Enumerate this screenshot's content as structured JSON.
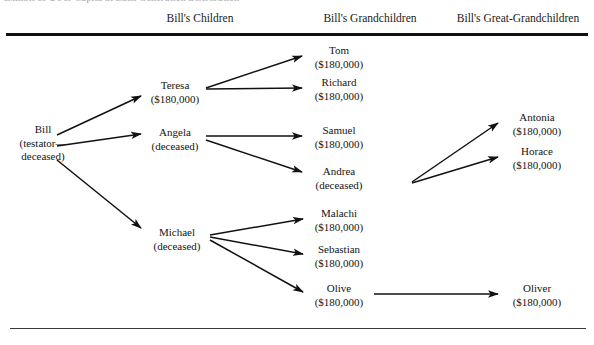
{
  "figure": {
    "clipped_caption": "Exhibit  19-2  Per Capita at Each Generation Distribution",
    "columns": [
      {
        "id": "children",
        "label": "Bill's Children"
      },
      {
        "id": "grandchildren",
        "label": "Bill's Grandchildren"
      },
      {
        "id": "great_grandchildren",
        "label": "Bill's Great-Grandchildren"
      }
    ],
    "nodes": [
      {
        "id": "bill",
        "name": "Bill",
        "sub1": "(testator—",
        "sub2": "deceased)",
        "generation": "testator",
        "amount": null
      },
      {
        "id": "teresa",
        "name": "Teresa",
        "sub1": "($180,000)",
        "sub2": "",
        "generation": "children",
        "amount": "$180,000"
      },
      {
        "id": "angela",
        "name": "Angela",
        "sub1": "(deceased)",
        "sub2": "",
        "generation": "children",
        "amount": null
      },
      {
        "id": "michael",
        "name": "Michael",
        "sub1": "(deceased)",
        "sub2": "",
        "generation": "children",
        "amount": null
      },
      {
        "id": "tom",
        "name": "Tom",
        "sub1": "($180,000)",
        "sub2": "",
        "generation": "grandchildren",
        "amount": "$180,000"
      },
      {
        "id": "richard",
        "name": "Richard",
        "sub1": "($180,000)",
        "sub2": "",
        "generation": "grandchildren",
        "amount": "$180,000"
      },
      {
        "id": "samuel",
        "name": "Samuel",
        "sub1": "($180,000)",
        "sub2": "",
        "generation": "grandchildren",
        "amount": "$180,000"
      },
      {
        "id": "andrea",
        "name": "Andrea",
        "sub1": "(deceased)",
        "sub2": "",
        "generation": "grandchildren",
        "amount": null
      },
      {
        "id": "malachi",
        "name": "Malachi",
        "sub1": "($180,000)",
        "sub2": "",
        "generation": "grandchildren",
        "amount": "$180,000"
      },
      {
        "id": "sebastian",
        "name": "Sebastian",
        "sub1": "($180,000)",
        "sub2": "",
        "generation": "grandchildren",
        "amount": "$180,000"
      },
      {
        "id": "olive",
        "name": "Olive",
        "sub1": "($180,000)",
        "sub2": "",
        "generation": "grandchildren",
        "amount": "$180,000"
      },
      {
        "id": "antonia",
        "name": "Antonia",
        "sub1": "($180,000)",
        "sub2": "",
        "generation": "great_grandchildren",
        "amount": "$180,000"
      },
      {
        "id": "horace",
        "name": "Horace",
        "sub1": "($180,000)",
        "sub2": "",
        "generation": "great_grandchildren",
        "amount": "$180,000"
      },
      {
        "id": "oliver",
        "name": "Oliver",
        "sub1": "($180,000)",
        "sub2": "",
        "generation": "great_grandchildren",
        "amount": "$180,000"
      }
    ],
    "edges": [
      {
        "from": "bill",
        "to": "teresa"
      },
      {
        "from": "bill",
        "to": "angela"
      },
      {
        "from": "bill",
        "to": "michael"
      },
      {
        "from": "teresa",
        "to": "tom"
      },
      {
        "from": "teresa",
        "to": "richard"
      },
      {
        "from": "angela",
        "to": "samuel"
      },
      {
        "from": "angela",
        "to": "andrea"
      },
      {
        "from": "michael",
        "to": "malachi"
      },
      {
        "from": "michael",
        "to": "sebastian"
      },
      {
        "from": "michael",
        "to": "olive"
      },
      {
        "from": "andrea",
        "to": "antonia"
      },
      {
        "from": "andrea",
        "to": "horace"
      },
      {
        "from": "olive",
        "to": "oliver"
      }
    ],
    "colors": {
      "rule": "#111111",
      "text": "#141414",
      "arrow": "#111111",
      "background": "#ffffff"
    }
  }
}
